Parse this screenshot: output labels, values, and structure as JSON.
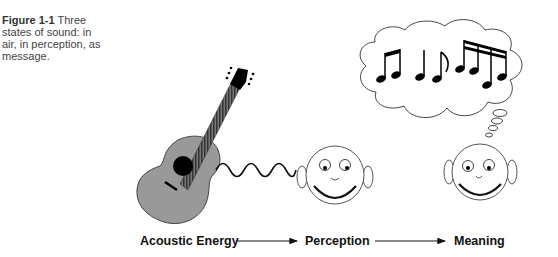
{
  "caption": {
    "figure_label": "Figure 1-1",
    "text": "Three states of sound: in air, in perception, as message."
  },
  "flow": {
    "stages": [
      "Acoustic Energy",
      "Perception",
      "Meaning"
    ]
  },
  "icons": {
    "instrument": "guitar-icon",
    "sound_wave": "sound-wave-icon",
    "listener": "smiling-face-icon",
    "thought": "thought-bubble-icon",
    "notes": "music-notes-icon"
  }
}
